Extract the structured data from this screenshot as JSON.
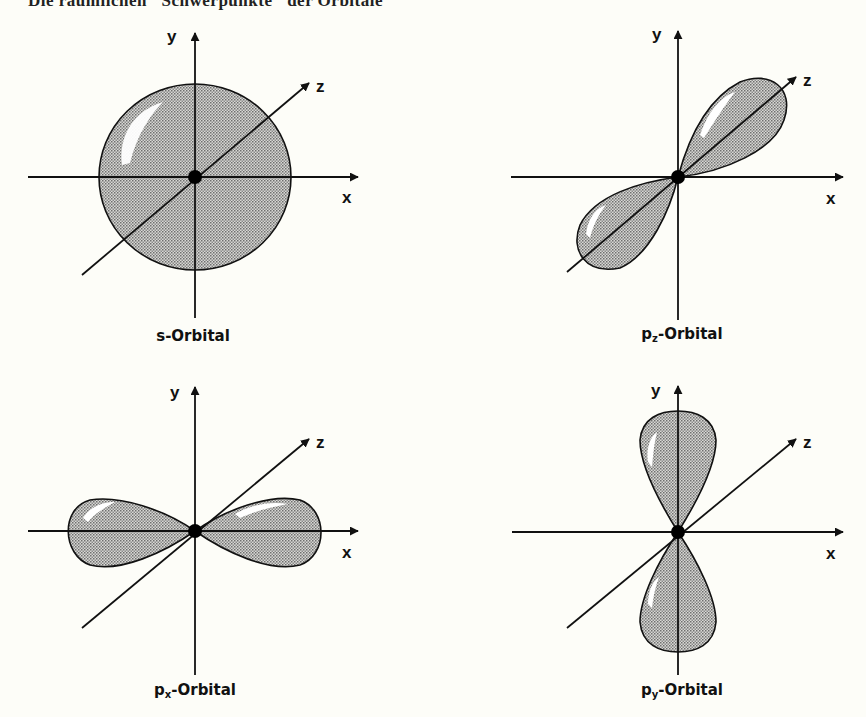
{
  "title": "Die räumlichen \"Schwerpunkte\" der Orbitale",
  "colors": {
    "background": "#fdfdf8",
    "fill": "#bdbdbd",
    "stroke": "#111111",
    "highlight": "#ffffff"
  },
  "axes": {
    "x_label": "x",
    "y_label": "y",
    "z_label": "z"
  },
  "panels": [
    {
      "id": "s",
      "base": "s",
      "sub": "",
      "suffix": "-Orbital",
      "shape": "sphere"
    },
    {
      "id": "pz",
      "base": "p",
      "sub": "z",
      "suffix": "-Orbital",
      "shape": "lobes-along-z"
    },
    {
      "id": "px",
      "base": "p",
      "sub": "x",
      "suffix": "-Orbital",
      "shape": "lobes-along-x"
    },
    {
      "id": "py",
      "base": "p",
      "sub": "y",
      "suffix": "-Orbital",
      "shape": "lobes-along-y"
    }
  ]
}
